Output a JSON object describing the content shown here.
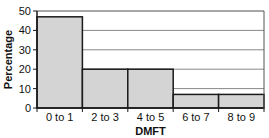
{
  "chart_data": {
    "type": "bar",
    "title": "",
    "xlabel": "DMFT",
    "ylabel": "Percentage",
    "categories": [
      "0 to 1",
      "2 to 3",
      "4 to 5",
      "6 to 7",
      "8 to 9"
    ],
    "values": [
      47,
      20,
      20,
      7,
      7
    ],
    "ylim": [
      0,
      50
    ],
    "yticks": [
      0,
      10,
      20,
      30,
      40,
      50
    ],
    "grid": true,
    "legend": null,
    "colors": {
      "bar_fill": "#d4d4d4",
      "bar_edge": "#1a1a1a",
      "grid": "#888888"
    }
  }
}
